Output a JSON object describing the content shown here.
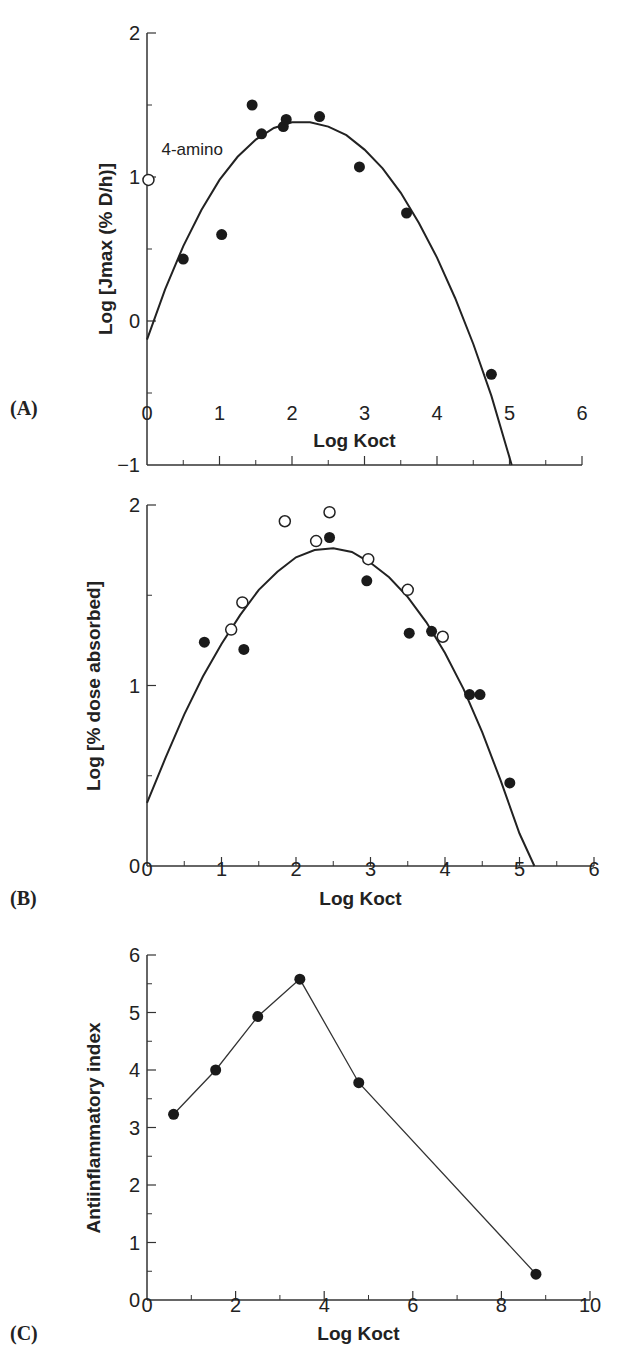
{
  "chart_data": [
    {
      "panel": "(A)",
      "type": "scatter",
      "title": "",
      "xlabel": "Log Koct",
      "ylabel": "Log [Jmax (% D/h)]",
      "xlim": [
        0,
        6
      ],
      "ylim": [
        -1,
        2
      ],
      "xticks": [
        0,
        1,
        2,
        3,
        4,
        5,
        6
      ],
      "yticks": [
        -1,
        0,
        1,
        2
      ],
      "grid": false,
      "annotations": [
        {
          "text": "4-amino",
          "x": 0.2,
          "y": 1.15
        }
      ],
      "series": [
        {
          "name": "filled",
          "marker": "filled-circle",
          "points": [
            [
              0.5,
              0.43
            ],
            [
              1.03,
              0.6
            ],
            [
              1.45,
              1.5
            ],
            [
              1.58,
              1.3
            ],
            [
              1.88,
              1.35
            ],
            [
              1.92,
              1.4
            ],
            [
              2.38,
              1.42
            ],
            [
              2.93,
              1.07
            ],
            [
              3.58,
              0.75
            ],
            [
              4.75,
              -0.37
            ]
          ]
        },
        {
          "name": "open",
          "marker": "open-circle",
          "points": [
            [
              0.02,
              0.98
            ]
          ]
        },
        {
          "name": "fit",
          "marker": "line",
          "points": [
            [
              0,
              -0.13
            ],
            [
              0.25,
              0.22
            ],
            [
              0.5,
              0.52
            ],
            [
              0.75,
              0.77
            ],
            [
              1.0,
              0.98
            ],
            [
              1.25,
              1.14
            ],
            [
              1.5,
              1.26
            ],
            [
              1.75,
              1.34
            ],
            [
              2.0,
              1.38
            ],
            [
              2.25,
              1.38
            ],
            [
              2.5,
              1.35
            ],
            [
              2.75,
              1.29
            ],
            [
              3.0,
              1.19
            ],
            [
              3.25,
              1.06
            ],
            [
              3.5,
              0.89
            ],
            [
              3.75,
              0.68
            ],
            [
              4.0,
              0.44
            ],
            [
              4.25,
              0.16
            ],
            [
              4.5,
              -0.16
            ],
            [
              4.75,
              -0.52
            ],
            [
              5.03,
              -1.0
            ]
          ]
        }
      ]
    },
    {
      "panel": "(B)",
      "type": "scatter",
      "title": "",
      "xlabel": "Log Koct",
      "ylabel": "Log [% dose absorbed]",
      "xlim": [
        0,
        6
      ],
      "ylim": [
        0,
        2
      ],
      "xticks": [
        0,
        1,
        2,
        3,
        4,
        5,
        6
      ],
      "yticks": [
        0,
        1,
        2
      ],
      "grid": false,
      "series": [
        {
          "name": "filled",
          "marker": "filled-circle",
          "points": [
            [
              0.77,
              1.24
            ],
            [
              1.3,
              1.2
            ],
            [
              2.45,
              1.82
            ],
            [
              2.95,
              1.58
            ],
            [
              3.52,
              1.29
            ],
            [
              3.82,
              1.3
            ],
            [
              4.33,
              0.95
            ],
            [
              4.47,
              0.95
            ],
            [
              4.87,
              0.46
            ]
          ]
        },
        {
          "name": "open",
          "marker": "open-circle",
          "points": [
            [
              1.13,
              1.31
            ],
            [
              1.28,
              1.46
            ],
            [
              1.85,
              1.91
            ],
            [
              2.27,
              1.8
            ],
            [
              2.45,
              1.96
            ],
            [
              2.97,
              1.7
            ],
            [
              3.5,
              1.53
            ],
            [
              3.97,
              1.27
            ]
          ]
        },
        {
          "name": "fit",
          "marker": "line",
          "points": [
            [
              0,
              0.35
            ],
            [
              0.25,
              0.6
            ],
            [
              0.5,
              0.84
            ],
            [
              0.75,
              1.05
            ],
            [
              1.0,
              1.23
            ],
            [
              1.25,
              1.39
            ],
            [
              1.5,
              1.53
            ],
            [
              1.75,
              1.63
            ],
            [
              2.0,
              1.71
            ],
            [
              2.25,
              1.75
            ],
            [
              2.5,
              1.76
            ],
            [
              2.75,
              1.74
            ],
            [
              3.0,
              1.68
            ],
            [
              3.25,
              1.6
            ],
            [
              3.5,
              1.49
            ],
            [
              3.75,
              1.35
            ],
            [
              4.0,
              1.18
            ],
            [
              4.25,
              0.98
            ],
            [
              4.5,
              0.74
            ],
            [
              4.75,
              0.47
            ],
            [
              5.0,
              0.18
            ],
            [
              5.2,
              0.0
            ]
          ]
        }
      ]
    },
    {
      "panel": "(C)",
      "type": "line",
      "title": "",
      "xlabel": "Log Koct",
      "ylabel": "Antiinflammatory index",
      "xlim": [
        0,
        10
      ],
      "ylim": [
        0,
        6
      ],
      "xticks": [
        0,
        2,
        4,
        6,
        8,
        10
      ],
      "yticks": [
        0,
        1,
        2,
        3,
        4,
        5,
        6
      ],
      "grid": false,
      "series": [
        {
          "name": "index",
          "marker": "filled-circle",
          "points": [
            [
              0.6,
              3.23
            ],
            [
              1.55,
              4.0
            ],
            [
              2.5,
              4.93
            ],
            [
              3.45,
              5.58
            ],
            [
              4.78,
              3.78
            ],
            [
              8.78,
              0.45
            ]
          ]
        }
      ]
    }
  ]
}
